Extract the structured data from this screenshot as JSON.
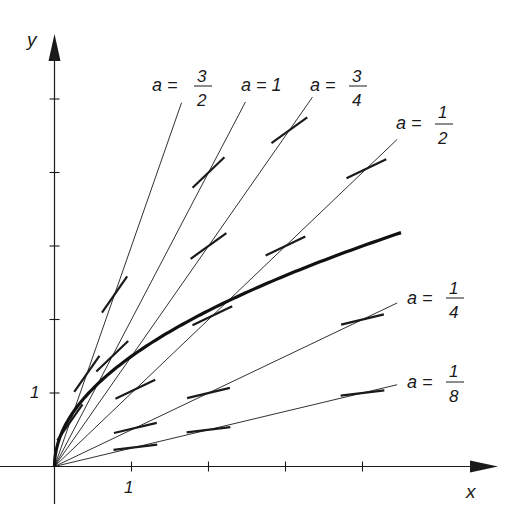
{
  "figure": {
    "type": "slope-field-isoclines",
    "axes": {
      "x_label": "x",
      "y_label": "y",
      "x_tick_label": "1",
      "y_tick_label": "1",
      "x_ticks": [
        1,
        2,
        3,
        4
      ],
      "y_ticks": [
        1,
        2,
        3,
        4,
        5
      ]
    },
    "isoclines": [
      {
        "name": "a-3-2",
        "label_prefix": "a =",
        "numerator": "3",
        "denominator": "2",
        "a": 1.5,
        "line_slope": 3.0,
        "x_end": 1.65,
        "slash_x": [
          0.2,
          0.42,
          0.78
        ]
      },
      {
        "name": "a-1",
        "label_prefix": "a = 1",
        "numerator": "",
        "denominator": "",
        "a": 1.0,
        "line_slope": 2.0,
        "x_end": 2.48,
        "slash_x": [
          0.75,
          2.0
        ]
      },
      {
        "name": "a-3-4",
        "label_prefix": "a =",
        "numerator": "3",
        "denominator": "4",
        "a": 0.75,
        "line_slope": 1.5,
        "x_end": 3.35,
        "slash_x": [
          2.0,
          3.05
        ]
      },
      {
        "name": "a-1-2",
        "label_prefix": "a =",
        "numerator": "1",
        "denominator": "2",
        "a": 0.5,
        "line_slope": 1.0,
        "x_end": 4.45,
        "slash_x": [
          1.05,
          2.05,
          3.0,
          4.05
        ]
      },
      {
        "name": "a-1-4",
        "label_prefix": "a =",
        "numerator": "1",
        "denominator": "4",
        "a": 0.25,
        "line_slope": 0.5,
        "x_end": 4.45,
        "slash_x": [
          1.05,
          2.0,
          4.0
        ]
      },
      {
        "name": "a-1-8",
        "label_prefix": "a =",
        "numerator": "1",
        "denominator": "8",
        "a": 0.125,
        "line_slope": 0.25,
        "x_end": 4.45,
        "slash_x": [
          1.05,
          2.0,
          4.0
        ]
      }
    ],
    "solution_curve": {
      "description": "y = 1.5 * sqrt(x)",
      "coefficient": 1.5,
      "x_start": 0,
      "x_end": 4.5
    },
    "colors": {
      "ink": "#1a1a1a",
      "background": "#ffffff"
    }
  }
}
